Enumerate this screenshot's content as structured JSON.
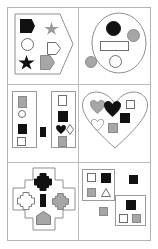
{
  "figure": {
    "width": 158,
    "height": 249,
    "background": "#ffffff",
    "frame_color": "#b3b3b3",
    "grid_line_color": "#bdbdbd",
    "outline_color": "#8f8f8f",
    "fills": {
      "black": "#111111",
      "gray": "#a6a6a6",
      "white": "#ffffff"
    },
    "grid": {
      "columns": 2,
      "rows": 3,
      "panel_count": 6
    }
  },
  "panels": [
    {
      "id": "panel-1",
      "position": "top-left",
      "container": {
        "shape": "hexagon",
        "fill": "none",
        "outline": "#8f8f8f"
      },
      "contents": [
        {
          "shape": "hexagon",
          "fill": "black"
        },
        {
          "shape": "star",
          "fill": "gray"
        },
        {
          "shape": "circle",
          "fill": "white"
        },
        {
          "shape": "pentagon",
          "fill": "white"
        },
        {
          "shape": "star",
          "fill": "black"
        },
        {
          "shape": "pentagon",
          "fill": "gray"
        }
      ]
    },
    {
      "id": "panel-2",
      "position": "top-right",
      "container": {
        "shape": "circle",
        "fill": "none",
        "outline": "#8f8f8f"
      },
      "contents": [
        {
          "shape": "circle",
          "fill": "black"
        },
        {
          "shape": "circle",
          "fill": "gray"
        },
        {
          "shape": "rectangle",
          "fill": "white"
        },
        {
          "shape": "circle",
          "fill": "white"
        }
      ],
      "outside": [
        {
          "shape": "circle",
          "fill": "gray"
        }
      ]
    },
    {
      "id": "panel-3",
      "position": "middle-left",
      "container": {
        "shape": "two-rectangles",
        "fill": "none",
        "outline": "#9a9a9a"
      },
      "contents_left_box": [
        {
          "shape": "square",
          "fill": "gray"
        },
        {
          "shape": "circle",
          "fill": "white"
        },
        {
          "shape": "square",
          "fill": "black"
        },
        {
          "shape": "square",
          "fill": "white"
        }
      ],
      "contents_right_box": [
        {
          "shape": "square",
          "fill": "white"
        },
        {
          "shape": "square",
          "fill": "black"
        },
        {
          "shape": "heart",
          "fill": "black"
        },
        {
          "shape": "diamond",
          "fill": "white"
        },
        {
          "shape": "square",
          "fill": "gray"
        }
      ],
      "outside": [
        {
          "shape": "rectangle",
          "fill": "black"
        }
      ]
    },
    {
      "id": "panel-4",
      "position": "middle-right",
      "container": {
        "shape": "heart",
        "fill": "none",
        "outline": "#8f8f8f"
      },
      "contents": [
        {
          "shape": "heart",
          "fill": "gray"
        },
        {
          "shape": "heart",
          "fill": "black"
        },
        {
          "shape": "square",
          "fill": "white"
        },
        {
          "shape": "square",
          "fill": "black"
        },
        {
          "shape": "heart",
          "fill": "white"
        },
        {
          "shape": "square",
          "fill": "gray"
        }
      ]
    },
    {
      "id": "panel-5",
      "position": "bottom-left",
      "container": {
        "shape": "cross",
        "fill": "none",
        "outline": "#8f8f8f"
      },
      "contents": [
        {
          "shape": "cross",
          "fill": "black"
        },
        {
          "shape": "cross",
          "fill": "white"
        },
        {
          "shape": "rectangle",
          "fill": "black"
        },
        {
          "shape": "cross",
          "fill": "gray"
        },
        {
          "shape": "pentagon",
          "fill": "gray"
        }
      ]
    },
    {
      "id": "panel-6",
      "position": "bottom-right",
      "container": {
        "shape": "two-squares",
        "fill": "none",
        "outline": "#9a9a9a"
      },
      "contents_upper_box": [
        {
          "shape": "square",
          "fill": "white"
        },
        {
          "shape": "square",
          "fill": "black"
        },
        {
          "shape": "square",
          "fill": "gray"
        },
        {
          "shape": "triangle",
          "fill": "white"
        }
      ],
      "contents_lower_box": [
        {
          "shape": "square",
          "fill": "black"
        },
        {
          "shape": "square",
          "fill": "white"
        },
        {
          "shape": "square",
          "fill": "gray"
        }
      ],
      "outside": [
        {
          "shape": "square",
          "fill": "black"
        },
        {
          "shape": "square",
          "fill": "gray"
        }
      ]
    }
  ]
}
